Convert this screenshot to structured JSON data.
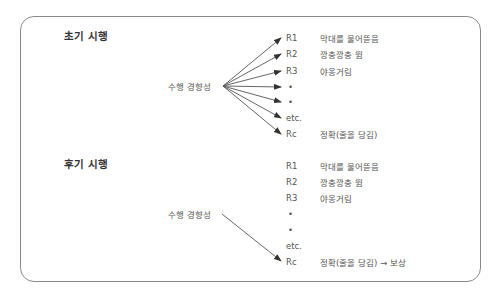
{
  "early": {
    "title": "초기 시행",
    "tendency": "수행 경향성",
    "responses": [
      {
        "code": "R1",
        "label": "막대를 물어뜯음"
      },
      {
        "code": "R2",
        "label": "깡충깡충 뜀"
      },
      {
        "code": "R3",
        "label": "야옹거림"
      },
      {
        "code": "•",
        "label": ""
      },
      {
        "code": "•",
        "label": ""
      },
      {
        "code": "etc.",
        "label": ""
      },
      {
        "code": "Rc",
        "label": "정확(줄을 당김)"
      }
    ]
  },
  "late": {
    "title": "후기 시행",
    "tendency": "수행 경향성",
    "responses": [
      {
        "code": "R1",
        "label": "막대를 물어뜯음"
      },
      {
        "code": "R2",
        "label": "깡충깡충 뜀"
      },
      {
        "code": "R3",
        "label": "야옹거림"
      },
      {
        "code": "•",
        "label": ""
      },
      {
        "code": "•",
        "label": ""
      },
      {
        "code": "etc.",
        "label": ""
      },
      {
        "code": "Rc",
        "label": "정확(줄을 당김) → 보상"
      }
    ]
  },
  "colors": {
    "frame": "#8a8a8a",
    "text": "#555555",
    "title": "#333333",
    "arrow": "#444444"
  }
}
